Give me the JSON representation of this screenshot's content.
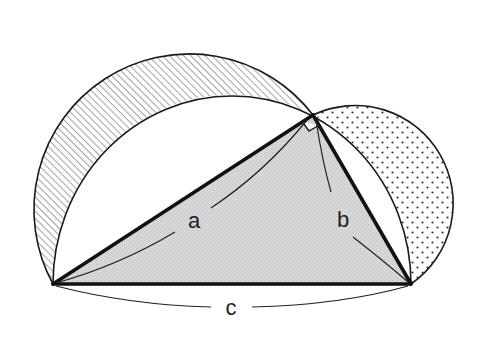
{
  "diagram": {
    "vertices": {
      "A": [
        53,
        284
      ],
      "B": [
        411,
        284
      ],
      "C": [
        313,
        115
      ]
    },
    "right_angle_at": "C",
    "labels": {
      "a": "a",
      "b": "b",
      "c": "c"
    },
    "label_positions": {
      "a": [
        194,
        228
      ],
      "b": [
        343,
        227
      ],
      "c": [
        231,
        315
      ]
    },
    "regions": {
      "triangle_fill": "#d4d4d4",
      "lune_a_pattern": "diagonal-hatch",
      "lune_b_pattern": "dots",
      "background": "#ffffff"
    },
    "colors": {
      "stroke": "#1a1a1a",
      "hatch": "#555555",
      "dot": "#333333"
    }
  }
}
